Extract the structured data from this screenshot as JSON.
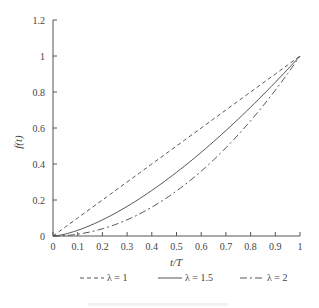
{
  "chart_data": {
    "type": "line",
    "title": "",
    "xlabel": "t/T",
    "ylabel": "f(t)",
    "xlim": [
      0,
      1
    ],
    "ylim": [
      0,
      1.2
    ],
    "xticks": [
      "0",
      "0.1",
      "0.2",
      "0.3",
      "0.4",
      "0.5",
      "0.6",
      "0.7",
      "0.8",
      "0.9",
      "1"
    ],
    "yticks": [
      "0",
      "0.2",
      "0.4",
      "0.6",
      "0.8",
      "1",
      "1.2"
    ],
    "grid": false,
    "legend_position": "bottom",
    "x": [
      0,
      0.1,
      0.2,
      0.3,
      0.4,
      0.5,
      0.6,
      0.7,
      0.8,
      0.9,
      1.0
    ],
    "series": [
      {
        "name": "λ = 1",
        "style": "dashed",
        "values": [
          0,
          0.1,
          0.2,
          0.3,
          0.4,
          0.5,
          0.6,
          0.7,
          0.8,
          0.9,
          1.0
        ]
      },
      {
        "name": "λ = 1.5",
        "style": "solid",
        "values": [
          0,
          0.032,
          0.089,
          0.164,
          0.253,
          0.354,
          0.465,
          0.586,
          0.716,
          0.854,
          1.0
        ]
      },
      {
        "name": "λ = 2",
        "style": "dash-dot",
        "values": [
          0,
          0.01,
          0.04,
          0.09,
          0.16,
          0.25,
          0.36,
          0.49,
          0.64,
          0.81,
          1.0
        ]
      }
    ]
  },
  "legend": {
    "items": [
      {
        "label": "λ = 1",
        "style": "dashed"
      },
      {
        "label": "λ = 1.5",
        "style": "solid"
      },
      {
        "label": "λ = 2",
        "style": "dash-dot"
      }
    ]
  }
}
